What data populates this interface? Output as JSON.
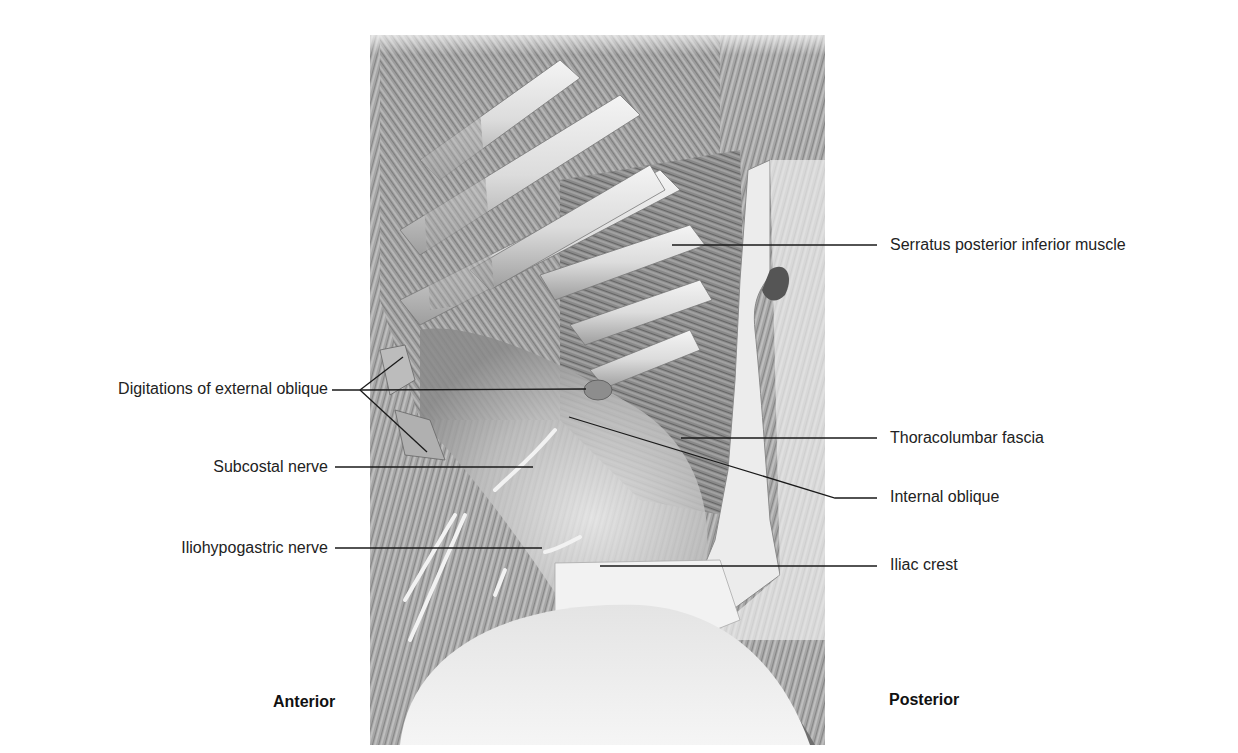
{
  "figure": {
    "orientation": {
      "left": "Anterior",
      "right": "Posterior"
    },
    "labels_left": [
      {
        "id": "digitations",
        "text": "Digitations of external oblique"
      },
      {
        "id": "subcostal",
        "text": "Subcostal nerve"
      },
      {
        "id": "iliohypogastric",
        "text": "Iliohypogastric nerve"
      }
    ],
    "labels_right": [
      {
        "id": "serratus",
        "text": "Serratus posterior inferior muscle"
      },
      {
        "id": "thoracolumbar",
        "text": "Thoracolumbar fascia"
      },
      {
        "id": "internal-oblique",
        "text": "Internal oblique"
      },
      {
        "id": "iliac-crest",
        "text": "Iliac crest"
      }
    ],
    "colors": {
      "text": "#222222",
      "leader": "#1a1a1a",
      "muscle_dark": "#5a5a5a",
      "muscle_light": "#d8d8d8",
      "fascia": "#ececec",
      "background": "#ffffff"
    }
  }
}
